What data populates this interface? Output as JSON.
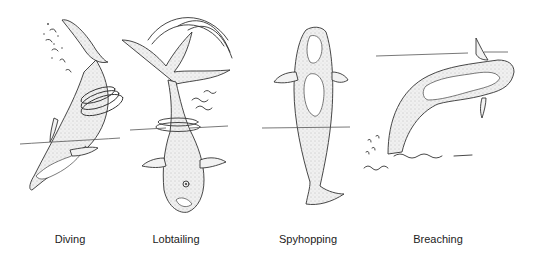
{
  "figure": {
    "background": "#ffffff",
    "line_color": "#333333",
    "panels": [
      {
        "id": "diving",
        "caption": "Diving"
      },
      {
        "id": "lobtailing",
        "caption": "Lobtailing"
      },
      {
        "id": "spyhopping",
        "caption": "Spyhopping"
      },
      {
        "id": "breaching",
        "caption": "Breaching"
      }
    ]
  }
}
